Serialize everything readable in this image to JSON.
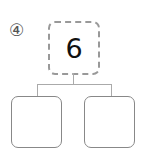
{
  "problem": {
    "number_label": "④"
  },
  "tree": {
    "root": {
      "value": "6"
    },
    "children": [
      {
        "value": ""
      },
      {
        "value": ""
      }
    ]
  }
}
